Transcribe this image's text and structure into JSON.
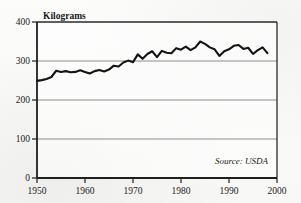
{
  "chart_data": {
    "type": "line",
    "title": "",
    "subtitle": "",
    "xlabel": "",
    "ylabel": "Kilograms",
    "ylim": [
      0,
      400
    ],
    "xlim": [
      1950,
      2000
    ],
    "yticks": [
      0,
      100,
      200,
      300,
      400
    ],
    "ytick_labels": [
      "0",
      "100",
      "200",
      "300",
      "400"
    ],
    "xticks": [
      1950,
      1960,
      1970,
      1980,
      1990,
      2000
    ],
    "xtick_labels": [
      "1950",
      "1960",
      "1970",
      "1980",
      "1990",
      "2000"
    ],
    "grid": "horizontal",
    "legend": "none",
    "annotations": [
      {
        "name": "source-note",
        "text": "Source: USDA",
        "position": "bottom-right-inside-plot"
      }
    ],
    "series": [
      {
        "name": "Per capita consumption",
        "color": "#141414",
        "line_width": 2.1,
        "x": [
          1950,
          1951,
          1952,
          1953,
          1954,
          1955,
          1956,
          1957,
          1958,
          1959,
          1960,
          1961,
          1962,
          1963,
          1964,
          1965,
          1966,
          1967,
          1968,
          1969,
          1970,
          1971,
          1972,
          1973,
          1974,
          1975,
          1976,
          1977,
          1978,
          1979,
          1980,
          1981,
          1982,
          1983,
          1984,
          1985,
          1986,
          1987,
          1988,
          1989,
          1990,
          1991,
          1992,
          1993,
          1994,
          1995,
          1996,
          1997,
          1998
        ],
        "values": [
          249,
          251,
          254,
          259,
          275,
          272,
          274,
          271,
          272,
          276,
          272,
          268,
          274,
          277,
          273,
          278,
          288,
          286,
          296,
          301,
          297,
          317,
          306,
          318,
          325,
          310,
          326,
          321,
          320,
          333,
          329,
          337,
          328,
          335,
          350,
          344,
          335,
          330,
          313,
          325,
          330,
          339,
          341,
          331,
          334,
          318,
          328,
          335,
          320
        ]
      }
    ]
  },
  "figure": {
    "axis_color": "#1f1f1f",
    "grid_color": "#8c8c8c",
    "background_color": "#fbfbfa"
  }
}
